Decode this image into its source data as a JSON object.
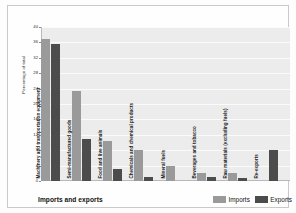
{
  "chart_data": {
    "type": "bar",
    "title": "",
    "xlabel": "Imports and exports",
    "ylabel": "Percentage of total",
    "ylim": [
      0,
      40
    ],
    "yticks": [
      0,
      4,
      8,
      12,
      16,
      20,
      24,
      28,
      32,
      36,
      40
    ],
    "grid": true,
    "legend_position": "bottom-right",
    "categories": [
      "Machinery and transportation equipment",
      "Semi-manufactured goods",
      "Food and live animals",
      "Chemicals and chemical products",
      "Mineral fuels",
      "Beverages and tobacco",
      "Raw materials (excluding fuels)",
      "Re-exports"
    ],
    "series": [
      {
        "name": "Imports",
        "color": "#9a9a9a",
        "values": [
          37,
          23.5,
          10.5,
          8,
          4,
          2,
          2,
          0
        ]
      },
      {
        "name": "Exports",
        "color": "#4c4c4c",
        "values": [
          35.5,
          11,
          3,
          1,
          0,
          1,
          0.8,
          8
        ]
      }
    ]
  },
  "legend": {
    "entries": [
      {
        "label": "Imports",
        "color": "#9a9a9a"
      },
      {
        "label": "Exports",
        "color": "#4c4c4c"
      }
    ]
  },
  "footer": {
    "xtitle": "Imports and exports"
  }
}
